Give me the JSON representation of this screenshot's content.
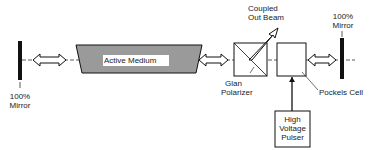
{
  "diagram": {
    "labels": {
      "left_mirror": [
        "100%",
        "Mirror"
      ],
      "right_mirror": [
        "100%",
        "Mirror"
      ],
      "active_medium": "Active Medium",
      "coupled_out_beam": [
        "Coupled",
        "Out Beam"
      ],
      "glan_polarizer": [
        "Glan",
        "Polarizer"
      ],
      "pockels_cell": "Pockels Cell",
      "hv_pulser": [
        "High",
        "Voltage",
        "Pulser"
      ]
    },
    "colors": {
      "line": "#1a1a1a",
      "medium_fill": "#9a9a9a",
      "background": "#ffffff"
    }
  }
}
